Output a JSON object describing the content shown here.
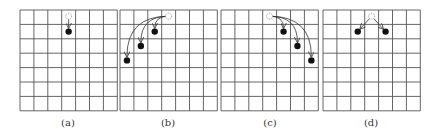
{
  "figure": {
    "grid": {
      "cols": 7,
      "rows": 7,
      "line_color": "#555555",
      "cell_w": 13.9,
      "cell_h": 14.4,
      "top": 10
    },
    "colors": {
      "dot": "#111111",
      "ghost": "#888888",
      "arrow": "#333333"
    },
    "panels": [
      {
        "id": "a",
        "label": "(a)",
        "left": 20,
        "source": {
          "col": 3,
          "row": 0
        },
        "targets": [
          {
            "col": 3,
            "row": 1
          }
        ],
        "curved": false
      },
      {
        "id": "b",
        "label": "(b)",
        "left": 120,
        "source": {
          "col": 3,
          "row": 0
        },
        "targets": [
          {
            "col": 2,
            "row": 1
          },
          {
            "col": 1,
            "row": 2
          },
          {
            "col": 0,
            "row": 3
          }
        ],
        "curved": true
      },
      {
        "id": "c",
        "label": "(c)",
        "left": 221,
        "source": {
          "col": 3,
          "row": 0
        },
        "targets": [
          {
            "col": 4,
            "row": 1
          },
          {
            "col": 5,
            "row": 2
          },
          {
            "col": 6,
            "row": 3
          }
        ],
        "curved": true
      },
      {
        "id": "d",
        "label": "(d)",
        "left": 323,
        "source": {
          "col": 3,
          "row": 0
        },
        "targets": [
          {
            "col": 2,
            "row": 1
          },
          {
            "col": 4,
            "row": 1
          }
        ],
        "curved": false
      }
    ]
  }
}
